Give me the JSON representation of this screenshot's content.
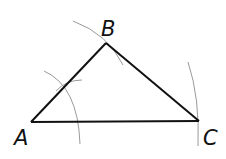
{
  "diagram": {
    "type": "geometric-construction",
    "shape": "triangle",
    "vertices": [
      {
        "label": "A",
        "x": 31,
        "y": 122
      },
      {
        "label": "B",
        "x": 106,
        "y": 43
      },
      {
        "label": "C",
        "x": 199,
        "y": 121
      }
    ],
    "colors": {
      "lines": "#111111",
      "arcs": "#9a9a9a",
      "labels": "#111111"
    }
  }
}
